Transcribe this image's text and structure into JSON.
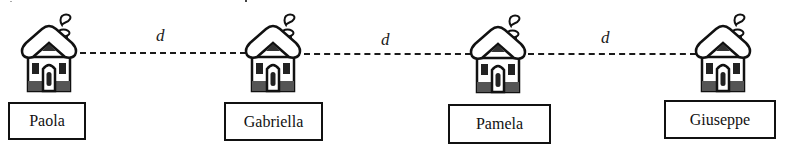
{
  "diagram": {
    "houses": [
      {
        "name": "Paola",
        "icon": "house-icon"
      },
      {
        "name": "Gabriella",
        "icon": "house-icon"
      },
      {
        "name": "Pamela",
        "icon": "house-icon"
      },
      {
        "name": "Giuseppe",
        "icon": "house-icon"
      }
    ],
    "distances": [
      {
        "label": "d",
        "from": "Paola",
        "to": "Gabriella"
      },
      {
        "label": "d",
        "from": "Gabriella",
        "to": "Pamela"
      },
      {
        "label": "d",
        "from": "Pamela",
        "to": "Giuseppe"
      }
    ],
    "colors": {
      "ink": "#111111",
      "roof_shade": "#555555",
      "background": "#ffffff"
    }
  }
}
